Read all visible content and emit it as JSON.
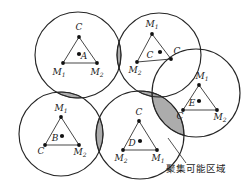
{
  "figure": {
    "title": "",
    "colors": {
      "stroke": "#262626",
      "lens_fill": "#9e9e9e",
      "lens_stroke": "#3a3a3a",
      "node_fill": "#111111",
      "text": "#1a1a1a",
      "background": "#ffffff"
    },
    "annotation": {
      "text": "聚集可能区域",
      "x": 196,
      "y": 172,
      "leader_from_x": 186,
      "leader_from_y": 163,
      "leader_to_x": 168,
      "leader_to_y": 138
    },
    "circles": [
      {
        "id": "circle-a",
        "cx": 78,
        "cy": 55,
        "r": 43
      },
      {
        "id": "circle-c",
        "cx": 159,
        "cy": 55,
        "r": 42
      },
      {
        "id": "circle-e",
        "cx": 196,
        "cy": 93,
        "r": 44
      },
      {
        "id": "circle-b",
        "cx": 61,
        "cy": 134,
        "r": 42
      },
      {
        "id": "circle-d",
        "cx": 140,
        "cy": 135,
        "r": 44
      }
    ],
    "groups": [
      {
        "id": "group-a",
        "center_label": "A",
        "center_label_x": 84,
        "center_label_y": 59,
        "center_dot": {
          "x": 79,
          "y": 54
        },
        "vertices": [
          {
            "label": "C",
            "sub": "",
            "x": 79,
            "y": 37,
            "lx": 79,
            "ly": 30,
            "anchor": "middle"
          },
          {
            "label": "M",
            "sub": "1",
            "x": 63,
            "y": 63,
            "lx": 59,
            "ly": 75,
            "anchor": "middle"
          },
          {
            "label": "M",
            "sub": "2",
            "x": 97,
            "y": 63,
            "lx": 97,
            "ly": 75,
            "anchor": "middle"
          }
        ]
      },
      {
        "id": "group-c",
        "center_label": "C",
        "center_label_x": 150,
        "center_label_y": 58,
        "center_dot": {
          "x": 160,
          "y": 52
        },
        "vertices": [
          {
            "label": "M",
            "sub": "1",
            "x": 152,
            "y": 34,
            "lx": 152,
            "ly": 27,
            "anchor": "middle"
          },
          {
            "label": "M",
            "sub": "2",
            "x": 137,
            "y": 62,
            "lx": 135,
            "ly": 73,
            "anchor": "middle"
          },
          {
            "label": "C",
            "sub": "",
            "x": 171,
            "y": 59,
            "lx": 177,
            "ly": 54,
            "anchor": "middle"
          }
        ]
      },
      {
        "id": "group-e",
        "center_label": "E",
        "center_label_x": 192,
        "center_label_y": 106,
        "center_dot": {
          "x": 199,
          "y": 101
        },
        "vertices": [
          {
            "label": "M",
            "sub": "1",
            "x": 199,
            "y": 85,
            "lx": 202,
            "ly": 79,
            "anchor": "middle"
          },
          {
            "label": "C",
            "sub": "",
            "x": 183,
            "y": 110,
            "lx": 180,
            "ly": 119,
            "anchor": "middle"
          },
          {
            "label": "M",
            "sub": "2",
            "x": 217,
            "y": 110,
            "lx": 220,
            "ly": 120,
            "anchor": "middle"
          }
        ]
      },
      {
        "id": "group-b",
        "center_label": "B",
        "center_label_x": 55,
        "center_label_y": 141,
        "center_dot": {
          "x": 62,
          "y": 136
        },
        "vertices": [
          {
            "label": "M",
            "sub": "1",
            "x": 61,
            "y": 117,
            "lx": 61,
            "ly": 111,
            "anchor": "middle"
          },
          {
            "label": "C",
            "sub": "",
            "x": 45,
            "y": 145,
            "lx": 41,
            "ly": 154,
            "anchor": "middle"
          },
          {
            "label": "M",
            "sub": "2",
            "x": 79,
            "y": 145,
            "lx": 80,
            "ly": 155,
            "anchor": "middle"
          }
        ]
      },
      {
        "id": "group-d",
        "center_label": "D",
        "center_label_x": 132,
        "center_label_y": 146,
        "center_dot": {
          "x": 140,
          "y": 141
        },
        "vertices": [
          {
            "label": "C",
            "sub": "",
            "x": 139,
            "y": 121,
            "lx": 139,
            "ly": 115,
            "anchor": "middle"
          },
          {
            "label": "M",
            "sub": "2",
            "x": 123,
            "y": 150,
            "lx": 121,
            "ly": 161,
            "anchor": "middle"
          },
          {
            "label": "M",
            "sub": "1",
            "x": 157,
            "y": 150,
            "lx": 158,
            "ly": 161,
            "anchor": "middle"
          }
        ]
      }
    ],
    "lenses": [
      {
        "id": "lens-a-c",
        "pair": [
          "circle-a",
          "circle-c"
        ]
      },
      {
        "id": "lens-a-b",
        "pair": [
          "circle-a",
          "circle-b"
        ]
      },
      {
        "id": "lens-c-d",
        "pair": [
          "circle-c",
          "circle-d"
        ]
      },
      {
        "id": "lens-e-d",
        "pair": [
          "circle-e",
          "circle-d"
        ]
      },
      {
        "id": "lens-b-d",
        "pair": [
          "circle-b",
          "circle-d"
        ]
      }
    ]
  }
}
